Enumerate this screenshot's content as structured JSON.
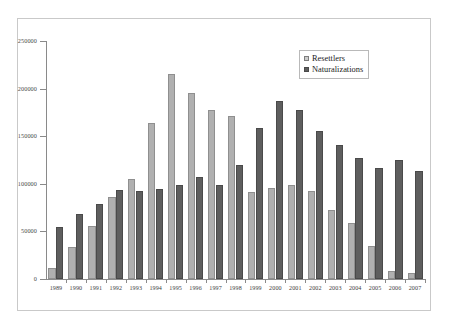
{
  "chart_data": {
    "type": "bar",
    "title": "",
    "subtitle": "",
    "xlabel": "",
    "ylabel": "",
    "ylim": [
      0,
      250000
    ],
    "ytick_step": 50000,
    "ytick_labels": [
      "250000",
      "200000",
      "150000",
      "100000",
      "50000",
      "0"
    ],
    "ytick_values": [
      250000,
      200000,
      150000,
      100000,
      50000,
      0
    ],
    "grid": false,
    "legend_position": "top-right",
    "categories": [
      "1989",
      "1990",
      "1991",
      "1992",
      "1993",
      "1994",
      "1995",
      "1996",
      "1997",
      "1998",
      "1999",
      "2000",
      "2001",
      "2002",
      "2003",
      "2004",
      "2005",
      "2006",
      "2007"
    ],
    "series": [
      {
        "name": "Resettlers",
        "color": "#b0b0b0",
        "values": [
          12000,
          34000,
          56000,
          86000,
          105000,
          164000,
          215000,
          195000,
          178000,
          171000,
          91000,
          96000,
          99000,
          92000,
          73000,
          59000,
          35000,
          8000,
          6000
        ]
      },
      {
        "name": "Naturalizations",
        "color": "#5e5e5e",
        "values": [
          55000,
          68000,
          79000,
          93000,
          92000,
          95000,
          99000,
          107000,
          99000,
          120000,
          159000,
          187000,
          178000,
          155000,
          141000,
          127000,
          117000,
          125000,
          113000
        ]
      }
    ]
  },
  "legend": {
    "items": [
      {
        "label": "Resettlers"
      },
      {
        "label": "Naturalizations"
      }
    ]
  }
}
